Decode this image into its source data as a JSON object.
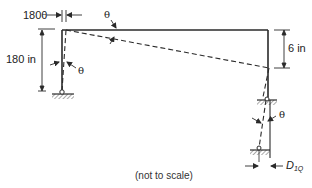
{
  "diagram": {
    "type": "structural frame deflection diagram",
    "labels": {
      "top_left_offset": "180θ",
      "top_theta": "θ",
      "left_height": "180 in",
      "left_theta": "θ",
      "right_drop": "6 in",
      "lower_theta": "θ",
      "displacement_base": "D",
      "displacement_sub": "1Q",
      "note": "(not to scale)"
    },
    "colors": {
      "line": "#2a2a2a",
      "background": "#ffffff"
    }
  }
}
